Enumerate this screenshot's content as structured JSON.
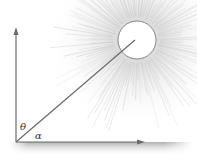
{
  "diagram": {
    "labels": {
      "zenith_angle": "θ",
      "elevation_angle": "α"
    },
    "elements": {
      "vertical_axis": "zenith direction",
      "horizontal_axis": "horizon",
      "sun": "sun",
      "sun_ray": "line of sight to sun",
      "ground": "ground surface"
    },
    "colors": {
      "line": "#6b6b6b",
      "sun_fill": "#ffffff",
      "sun_outline": "#7a7a7a",
      "rays": "#c8c8c8",
      "ground": "#b5b5b5"
    }
  }
}
